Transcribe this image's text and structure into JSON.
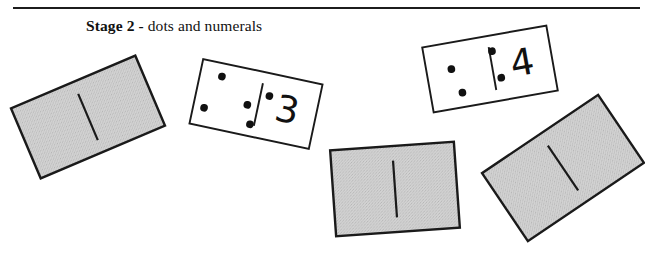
{
  "figure": {
    "caption": {
      "emphasis": "Stage 2 -",
      "rest": " dots and numerals"
    },
    "rule_color": "#1c1c1c",
    "ink_color": "#111111",
    "card_back_color": "#c8c8c8",
    "card_face_color": "#ffffff",
    "cards": [
      {
        "id": "card-back-left",
        "kind": "face-down",
        "label": "face-down domino",
        "numeral": "",
        "pip_count": 0,
        "center_x": 88,
        "center_y": 117,
        "width": 135,
        "height": 76,
        "rotation": -23
      },
      {
        "id": "card-face-three",
        "kind": "face-up",
        "label": "domino showing five dots and numeral 3",
        "numeral": "3",
        "pip_count": 5,
        "pip_pattern": "quincunx",
        "center_x": 256,
        "center_y": 104,
        "width": 122,
        "height": 66,
        "rotation": 12
      },
      {
        "id": "card-face-four",
        "kind": "face-up",
        "label": "domino showing four dots and numeral 4",
        "numeral": "4",
        "pip_count": 4,
        "pip_pattern": "square",
        "center_x": 490,
        "center_y": 69,
        "width": 126,
        "height": 66,
        "rotation": -10
      },
      {
        "id": "card-back-center",
        "kind": "face-down",
        "label": "face-down domino",
        "numeral": "",
        "pip_count": 0,
        "center_x": 395,
        "center_y": 189,
        "width": 124,
        "height": 86,
        "rotation": -4
      },
      {
        "id": "card-back-right",
        "kind": "face-down",
        "label": "face-down domino",
        "numeral": "",
        "pip_count": 0,
        "center_x": 563,
        "center_y": 168,
        "width": 140,
        "height": 82,
        "rotation": -34
      }
    ]
  }
}
